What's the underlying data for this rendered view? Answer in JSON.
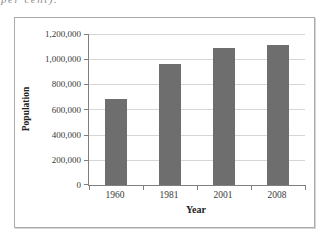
{
  "page": {
    "corner_fragment": "per cent)."
  },
  "chart_data": {
    "type": "bar",
    "title": "",
    "categories": [
      "1960",
      "1981",
      "2001",
      "2008"
    ],
    "values": [
      680000,
      960000,
      1090000,
      1115000
    ],
    "xlabel": "Year",
    "ylabel": "Population",
    "ylim": [
      0,
      1200000
    ],
    "ytick_interval": 200000,
    "ytick_labels": [
      "0",
      "200,000",
      "400,000",
      "600,000",
      "800,000",
      "1,000,000",
      "1,200,000"
    ],
    "grid": true,
    "legend": false,
    "colors": {
      "bar_fill": "#6e6e6e",
      "gridline": "#d6d6d6",
      "axis_line": "#7f7f7f",
      "frame_border": "#ababab",
      "tick_text": "#3a3a3a",
      "background": "#ffffff"
    }
  }
}
